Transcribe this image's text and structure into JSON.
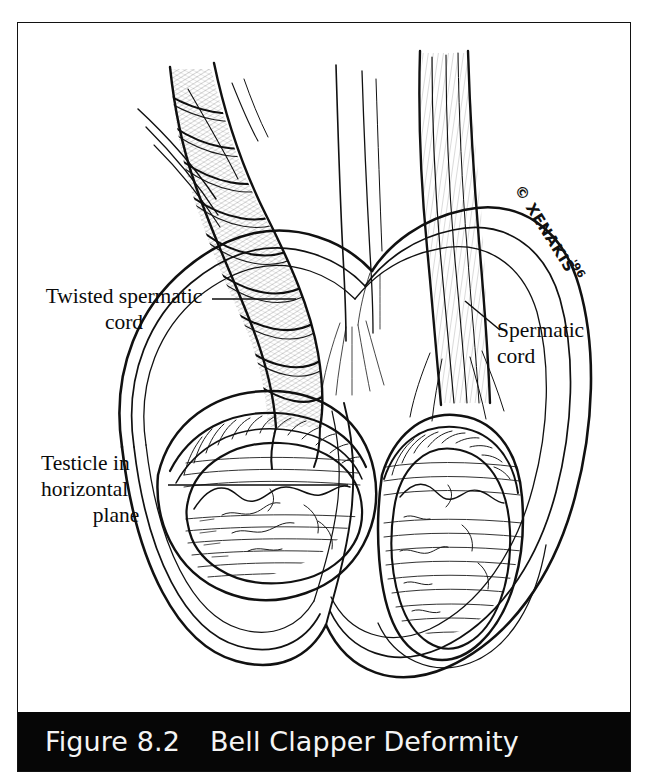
{
  "figure": {
    "caption_number": "Figure 8.2",
    "caption_title": "Bell Clapper Deformity",
    "caption_bar_color": "#060606",
    "caption_text_color": "#f4f4f4",
    "border_color": "#121212",
    "background_color": "#ffffff",
    "ink_color": "#111111"
  },
  "labels": {
    "twisted_cord": {
      "line1": "Twisted spermatic",
      "line2": "cord"
    },
    "testicle": {
      "line1": "Testicle in",
      "line2": "horizontal",
      "line3": "plane"
    },
    "spermatic_cord": {
      "line1": "Spermatic",
      "line2": "cord"
    }
  },
  "artist_credit": {
    "mark": "© XENAKIS",
    "year": "'96"
  },
  "illustration": {
    "description": "Pen-and-ink medical illustration of the scrotum in coronal section showing bell clapper deformity: the left testicle lies in a horizontal plane with a twisted (torsed) spermatic cord, while the right testicle hangs vertically from a normal spermatic cord.",
    "parts": [
      "twisted-spermatic-cord",
      "normal-spermatic-cord",
      "left-testicle-horizontal",
      "right-testicle-vertical",
      "tunica-vaginalis",
      "scrotal-wall",
      "scrotal-septum",
      "epididymis"
    ]
  }
}
